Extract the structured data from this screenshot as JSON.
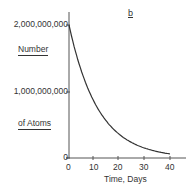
{
  "panel_label": "b",
  "chart_data": {
    "type": "line",
    "title": "",
    "panel": "b",
    "xlabel": "Time, Days",
    "ylabel": [
      "Number",
      "of Atoms"
    ],
    "xlim": [
      0,
      45
    ],
    "ylim": [
      0,
      2000000000
    ],
    "x_ticks": [
      "0",
      "10",
      "20",
      "30",
      "40"
    ],
    "y_ticks": [
      "0",
      "1,000,000,000",
      "2,000,000,000"
    ],
    "grid": false,
    "legend": null,
    "series": [
      {
        "name": "Number of atoms (exponential decay, half-life ≈ 8 days)",
        "x": [
          0,
          4,
          8,
          12,
          16,
          20,
          24,
          28,
          32,
          36,
          40
        ],
        "y": [
          2000000000,
          1414000000,
          1000000000,
          707000000,
          500000000,
          354000000,
          250000000,
          177000000,
          125000000,
          88000000,
          62500000
        ]
      }
    ]
  },
  "axis": {
    "y_tick_0": "0",
    "y_tick_1": "1,000,000,000",
    "y_tick_2": "2,000,000,000",
    "x_tick_0": "0",
    "x_tick_1": "10",
    "x_tick_2": "20",
    "x_tick_3": "30",
    "x_tick_4": "40",
    "xlabel": "Time,  Days",
    "ylabel_line1": "Number",
    "ylabel_line2": "of Atoms"
  }
}
